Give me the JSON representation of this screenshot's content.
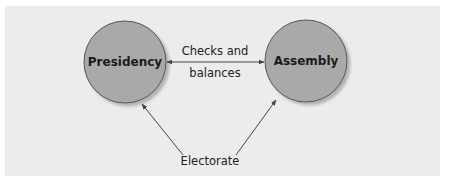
{
  "diagram": {
    "type": "flow",
    "background": "#ececec",
    "node_fill": "#a9a9a9",
    "node_stroke": "#555555",
    "arrow_color": "#444444",
    "nodes": [
      {
        "id": "presidency",
        "label": "Presidency",
        "shape": "circle"
      },
      {
        "id": "assembly",
        "label": "Assembly",
        "shape": "circle"
      },
      {
        "id": "electorate",
        "label": "Electorate",
        "shape": "text"
      }
    ],
    "edges": [
      {
        "from": "presidency",
        "to": "assembly",
        "bidirectional": true,
        "label_line1": "Checks and",
        "label_line2": "balances"
      },
      {
        "from": "electorate",
        "to": "presidency",
        "bidirectional": false
      },
      {
        "from": "electorate",
        "to": "assembly",
        "bidirectional": false
      }
    ]
  }
}
